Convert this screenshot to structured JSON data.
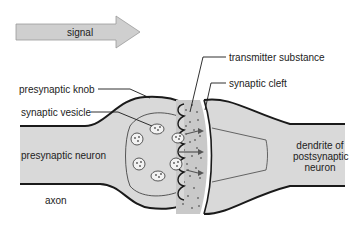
{
  "diagram": {
    "arrow_label": "signal",
    "labels": {
      "transmitter_substance": "transmitter substance",
      "synaptic_cleft": "synaptic cleft",
      "presynaptic_knob": "presynaptic knob",
      "synaptic_vesicle": "synaptic vesicle",
      "presynaptic_neuron": "presynaptic neuron",
      "dendrite_line1": "dendrite of",
      "dendrite_line2": "postsynaptic",
      "dendrite_line3": "neuron",
      "axon": "axon"
    },
    "colors": {
      "cell_fill": "#d9d9d9",
      "outline": "#1a1a1a",
      "arrow_fill": "#c8c8c8",
      "cleft_dots": "#777777"
    }
  }
}
